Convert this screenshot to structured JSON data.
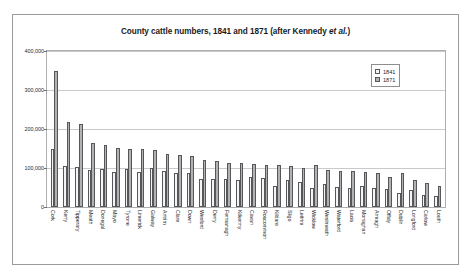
{
  "chart_data": {
    "type": "bar",
    "title": "County cattle numbers, 1841 and 1871 (after Kennedy et al.)",
    "title_plain": "County cattle numbers, 1841 and 1871 (after Kennedy ",
    "title_italic": "et al.",
    "title_tail": ")",
    "xlabel": "",
    "ylabel": "",
    "ylim": [
      0,
      400000
    ],
    "yticks": [
      0,
      100000,
      200000,
      300000,
      400000
    ],
    "ytick_labels": [
      "0",
      "100,000",
      "200,000",
      "300,000",
      "400,000"
    ],
    "grid": true,
    "legend_position": "top-right",
    "categories": [
      "Cork",
      "Kerry",
      "Tipperary",
      "Meath",
      "Donegal",
      "Mayo",
      "Tyrone",
      "Limerick",
      "Galway",
      "Antrim",
      "Clare",
      "Down",
      "Wexford",
      "Derry",
      "Fermanagh",
      "Kilkenny",
      "Cavan",
      "Roscommon",
      "Kildare",
      "Sligo",
      "Leitrim",
      "Wicklow",
      "Westmeath",
      "Waterford",
      "Laois",
      "Monaghan",
      "Armagh",
      "Offaly",
      "Dublin",
      "Longford",
      "Carlow",
      "Louth"
    ],
    "series": [
      {
        "name": "1841",
        "color": "#f4f4f4",
        "values": [
          148000,
          105000,
          103000,
          95000,
          97000,
          90000,
          98000,
          89000,
          100000,
          93000,
          88000,
          86000,
          72000,
          72000,
          72000,
          68000,
          78000,
          75000,
          55000,
          68000,
          64000,
          50000,
          58000,
          52000,
          50000,
          55000,
          48000,
          47000,
          36000,
          44000,
          30000,
          28000
        ]
      },
      {
        "name": "1871",
        "color": "#b2b2b2",
        "values": [
          348000,
          218000,
          213000,
          165000,
          158000,
          152000,
          148000,
          148000,
          145000,
          135000,
          133000,
          130000,
          120000,
          118000,
          112000,
          112000,
          110000,
          108000,
          108000,
          105000,
          100000,
          108000,
          95000,
          92000,
          92000,
          90000,
          88000,
          78000,
          88000,
          70000,
          62000,
          55000
        ]
      }
    ]
  },
  "legend": {
    "items": [
      {
        "label": "1841"
      },
      {
        "label": "1871"
      }
    ]
  }
}
